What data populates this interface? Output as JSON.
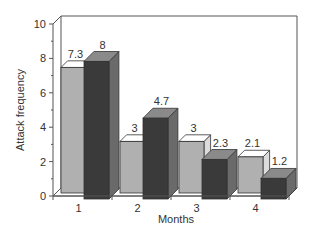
{
  "chart_data": {
    "type": "bar",
    "style": "3d-grouped",
    "title": "",
    "xlabel": "Months",
    "ylabel": "Attack frequency",
    "categories": [
      "1",
      "2",
      "3",
      "4"
    ],
    "series": [
      {
        "name": "Series A",
        "color": "#b0b0b0",
        "values": [
          7.3,
          3,
          3,
          2.1
        ]
      },
      {
        "name": "Series B",
        "color": "#3a3a3a",
        "values": [
          8,
          4.7,
          2.3,
          1.2
        ]
      }
    ],
    "ylim": [
      0,
      10
    ],
    "yticks": [
      0,
      2,
      4,
      6,
      8,
      10
    ],
    "grid": false,
    "legend": "none"
  }
}
